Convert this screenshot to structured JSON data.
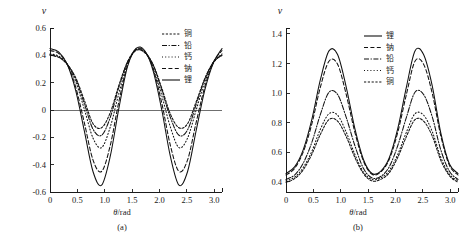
{
  "figure": {
    "panel_a_caption": "(a)",
    "panel_b_caption": "(b)",
    "y_symbol": "ν",
    "x_axis_title_symbol": "θ",
    "x_axis_title_unit": "/rad"
  },
  "chart_data": [
    {
      "type": "line",
      "title": "(a)",
      "xlabel": "θ/rad",
      "ylabel": "ν",
      "xlim": [
        0,
        3.14159
      ],
      "ylim": [
        -0.6,
        0.6
      ],
      "xticks": [
        "0",
        "0.5",
        "1.0",
        "1.5",
        "2.0",
        "2.5",
        "3.0"
      ],
      "xtick_values": [
        0,
        0.5,
        1.0,
        1.5,
        2.0,
        2.5,
        3.0
      ],
      "yticks": [
        "0.6",
        "0.4",
        "0.2",
        "0",
        "-0.2",
        "-0.4",
        "-0.6"
      ],
      "ytick_values": [
        0.6,
        0.4,
        0.2,
        0,
        -0.2,
        -0.4,
        -0.6
      ],
      "grid": false,
      "legend_position": "top-right",
      "zero_line": true,
      "series": [
        {
          "name": "铜",
          "style": "fine-dash",
          "dasharray": "2.2,1.6",
          "start": 0.4,
          "peak_mid": 0.435,
          "min": -0.13,
          "end": 0.4,
          "x": [
            0,
            0.157,
            0.314,
            0.471,
            0.628,
            0.785,
            0.942,
            1.1,
            1.257,
            1.414,
            1.571,
            1.728,
            1.885,
            2.042,
            2.199,
            2.356,
            2.513,
            2.67,
            2.827,
            2.985,
            3.142
          ],
          "values": [
            0.4,
            0.385,
            0.335,
            0.235,
            0.07,
            -0.1,
            -0.13,
            -0.02,
            0.18,
            0.35,
            0.435,
            0.42,
            0.33,
            0.16,
            -0.03,
            -0.13,
            -0.1,
            0.06,
            0.23,
            0.35,
            0.4
          ]
        },
        {
          "name": "铅",
          "style": "dash-dot",
          "dasharray": "5,1.6,1.2,1.6",
          "start": 0.405,
          "peak_mid": 0.44,
          "min": -0.185,
          "end": 0.405,
          "x": [
            0,
            0.157,
            0.314,
            0.471,
            0.628,
            0.785,
            0.942,
            1.1,
            1.257,
            1.414,
            1.571,
            1.728,
            1.885,
            2.042,
            2.199,
            2.356,
            2.513,
            2.67,
            2.827,
            2.985,
            3.142
          ],
          "values": [
            0.405,
            0.39,
            0.335,
            0.225,
            0.045,
            -0.14,
            -0.185,
            -0.055,
            0.165,
            0.35,
            0.44,
            0.425,
            0.33,
            0.145,
            -0.055,
            -0.185,
            -0.145,
            0.04,
            0.225,
            0.35,
            0.405
          ]
        },
        {
          "name": "钙",
          "style": "dotted",
          "dasharray": "1,2.2",
          "start": 0.41,
          "peak_mid": 0.44,
          "min": -0.275,
          "end": 0.41,
          "x": [
            0,
            0.157,
            0.314,
            0.471,
            0.628,
            0.785,
            0.942,
            1.1,
            1.257,
            1.414,
            1.571,
            1.728,
            1.885,
            2.042,
            2.199,
            2.356,
            2.513,
            2.67,
            2.827,
            2.985,
            3.142
          ],
          "values": [
            0.41,
            0.395,
            0.335,
            0.205,
            0.005,
            -0.205,
            -0.275,
            -0.125,
            0.12,
            0.335,
            0.44,
            0.425,
            0.315,
            0.105,
            -0.125,
            -0.275,
            -0.205,
            0.0,
            0.205,
            0.345,
            0.41
          ]
        },
        {
          "name": "钠",
          "style": "dashed",
          "dasharray": "4,2.4",
          "start": 0.435,
          "peak_mid": 0.445,
          "min": -0.45,
          "end": 0.435,
          "x": [
            0,
            0.157,
            0.314,
            0.471,
            0.628,
            0.785,
            0.942,
            1.1,
            1.257,
            1.414,
            1.571,
            1.728,
            1.885,
            2.042,
            2.199,
            2.356,
            2.513,
            2.67,
            2.827,
            2.985,
            3.142
          ],
          "values": [
            0.435,
            0.415,
            0.335,
            0.165,
            -0.095,
            -0.365,
            -0.45,
            -0.26,
            0.06,
            0.325,
            0.445,
            0.43,
            0.3,
            0.05,
            -0.26,
            -0.45,
            -0.365,
            -0.09,
            0.17,
            0.35,
            0.435
          ]
        },
        {
          "name": "锂",
          "style": "solid",
          "dasharray": "none",
          "start": 0.45,
          "peak_mid": 0.45,
          "min": -0.55,
          "end": 0.45,
          "x": [
            0,
            0.157,
            0.314,
            0.471,
            0.628,
            0.785,
            0.942,
            1.1,
            1.257,
            1.414,
            1.571,
            1.728,
            1.885,
            2.042,
            2.199,
            2.356,
            2.513,
            2.67,
            2.827,
            2.985,
            3.142
          ],
          "values": [
            0.45,
            0.425,
            0.335,
            0.14,
            -0.155,
            -0.45,
            -0.55,
            -0.34,
            0.01,
            0.315,
            0.45,
            0.435,
            0.285,
            0.0,
            -0.34,
            -0.55,
            -0.45,
            -0.15,
            0.145,
            0.345,
            0.45
          ]
        }
      ]
    },
    {
      "type": "line",
      "title": "(b)",
      "xlabel": "θ/rad",
      "ylabel": "ν",
      "xlim": [
        0,
        3.14159
      ],
      "ylim": [
        0.33,
        1.44
      ],
      "xticks": [
        "0",
        "0.5",
        "1.0",
        "1.5",
        "2.0",
        "2.5",
        "3.0"
      ],
      "xtick_values": [
        0,
        0.5,
        1.0,
        1.5,
        2.0,
        2.5,
        3.0
      ],
      "yticks": [
        "1.4",
        "1.2",
        "1.0",
        "0.8",
        "0.6",
        "0.4"
      ],
      "ytick_values": [
        1.4,
        1.2,
        1.0,
        0.8,
        0.6,
        0.4
      ],
      "grid": false,
      "legend_position": "top-right",
      "zero_line": false,
      "series": [
        {
          "name": "锂",
          "style": "solid",
          "dasharray": "none",
          "start": 0.455,
          "peak": 1.29,
          "min_mid": 0.455,
          "end": 0.455,
          "x": [
            0,
            0.157,
            0.314,
            0.471,
            0.628,
            0.785,
            0.942,
            1.1,
            1.257,
            1.414,
            1.571,
            1.728,
            1.885,
            2.042,
            2.199,
            2.356,
            2.513,
            2.67,
            2.827,
            2.985,
            3.142
          ],
          "values": [
            0.455,
            0.5,
            0.615,
            0.82,
            1.09,
            1.285,
            1.26,
            1.04,
            0.76,
            0.55,
            0.455,
            0.47,
            0.56,
            0.76,
            1.04,
            1.285,
            1.26,
            1.05,
            0.73,
            0.52,
            0.455
          ]
        },
        {
          "name": "钠",
          "style": "dashed",
          "dasharray": "4,2.4",
          "start": 0.445,
          "peak": 1.22,
          "min_mid": 0.45,
          "end": 0.445,
          "x": [
            0,
            0.157,
            0.314,
            0.471,
            0.628,
            0.785,
            0.942,
            1.1,
            1.257,
            1.414,
            1.571,
            1.728,
            1.885,
            2.042,
            2.199,
            2.356,
            2.513,
            2.67,
            2.827,
            2.985,
            3.142
          ],
          "values": [
            0.445,
            0.49,
            0.6,
            0.79,
            1.04,
            1.215,
            1.195,
            0.99,
            0.735,
            0.54,
            0.45,
            0.465,
            0.55,
            0.735,
            0.99,
            1.215,
            1.195,
            1.0,
            0.71,
            0.51,
            0.445
          ]
        },
        {
          "name": "铅",
          "style": "dash-dot",
          "dasharray": "5,1.6,1.2,1.6",
          "start": 0.415,
          "peak": 1.01,
          "min_mid": 0.425,
          "end": 0.415,
          "x": [
            0,
            0.157,
            0.314,
            0.471,
            0.628,
            0.785,
            0.942,
            1.1,
            1.257,
            1.414,
            1.571,
            1.728,
            1.885,
            2.042,
            2.199,
            2.356,
            2.513,
            2.67,
            2.827,
            2.985,
            3.142
          ],
          "values": [
            0.415,
            0.445,
            0.525,
            0.665,
            0.855,
            1.005,
            0.99,
            0.835,
            0.645,
            0.49,
            0.425,
            0.435,
            0.5,
            0.645,
            0.835,
            1.005,
            0.99,
            0.84,
            0.615,
            0.47,
            0.415
          ]
        },
        {
          "name": "钙",
          "style": "dotted",
          "dasharray": "1,2.2",
          "start": 0.405,
          "peak": 0.86,
          "min_mid": 0.415,
          "end": 0.405,
          "x": [
            0,
            0.157,
            0.314,
            0.471,
            0.628,
            0.785,
            0.942,
            1.1,
            1.257,
            1.414,
            1.571,
            1.728,
            1.885,
            2.042,
            2.199,
            2.356,
            2.513,
            2.67,
            2.827,
            2.985,
            3.142
          ],
          "values": [
            0.405,
            0.43,
            0.495,
            0.605,
            0.755,
            0.86,
            0.85,
            0.735,
            0.585,
            0.465,
            0.415,
            0.425,
            0.475,
            0.585,
            0.735,
            0.86,
            0.85,
            0.74,
            0.565,
            0.45,
            0.405
          ]
        },
        {
          "name": "铜",
          "style": "fine-dash",
          "dasharray": "2.2,1.6",
          "start": 0.395,
          "peak": 0.82,
          "min_mid": 0.405,
          "end": 0.395,
          "x": [
            0,
            0.157,
            0.314,
            0.471,
            0.628,
            0.785,
            0.942,
            1.1,
            1.257,
            1.414,
            1.571,
            1.728,
            1.885,
            2.042,
            2.199,
            2.356,
            2.513,
            2.67,
            2.827,
            2.985,
            3.142
          ],
          "values": [
            0.395,
            0.42,
            0.48,
            0.585,
            0.72,
            0.82,
            0.81,
            0.705,
            0.565,
            0.455,
            0.405,
            0.415,
            0.46,
            0.565,
            0.705,
            0.82,
            0.81,
            0.71,
            0.545,
            0.44,
            0.395
          ]
        }
      ]
    }
  ],
  "panel_a": {
    "legend": [
      {
        "label": "铜",
        "style": "fine-dash"
      },
      {
        "label": "铅",
        "style": "dash-dot"
      },
      {
        "label": "钙",
        "style": "dotted"
      },
      {
        "label": "钠",
        "style": "dashed"
      },
      {
        "label": "锂",
        "style": "solid"
      }
    ]
  },
  "panel_b": {
    "legend": [
      {
        "label": "锂",
        "style": "solid"
      },
      {
        "label": "钠",
        "style": "dashed"
      },
      {
        "label": "铅",
        "style": "dash-dot"
      },
      {
        "label": "钙",
        "style": "dotted"
      },
      {
        "label": "铜",
        "style": "fine-dash"
      }
    ]
  }
}
